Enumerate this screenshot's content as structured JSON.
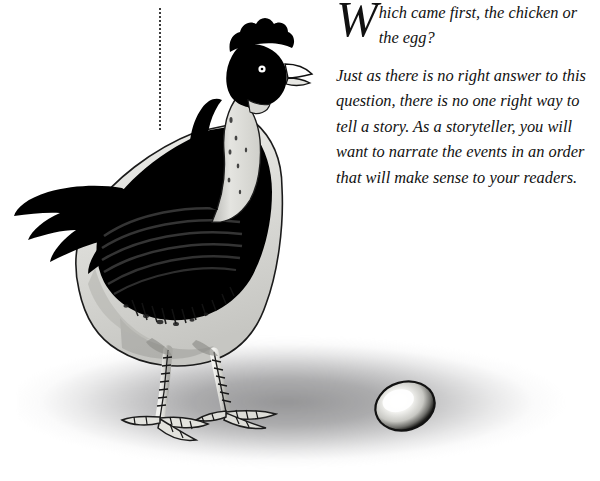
{
  "page": {
    "background_color": "#ffffff",
    "width": 600,
    "height": 481
  },
  "illustration": {
    "caption_none": "",
    "subject": "black-and-white pen-and-ink hen standing beside a single egg",
    "elements": {
      "chicken_name": "chicken-illustration",
      "egg_name": "egg-illustration",
      "shadow_name": "ground-shadow",
      "rule_name": "dotted-vertical-rule"
    },
    "colors": {
      "ink": "#000000",
      "shadow_gray": "#78787a",
      "paper": "#ffffff",
      "body_light": "#d8d8d4"
    }
  },
  "text": {
    "dropcap": "W",
    "lead_rest": "hich came first, the chicken or the egg?",
    "body": "Just as there is no right answer to this question, there is no one right way to tell a story. As a storyteller, you will want to narrate the events in an order that will make sense to your readers."
  }
}
